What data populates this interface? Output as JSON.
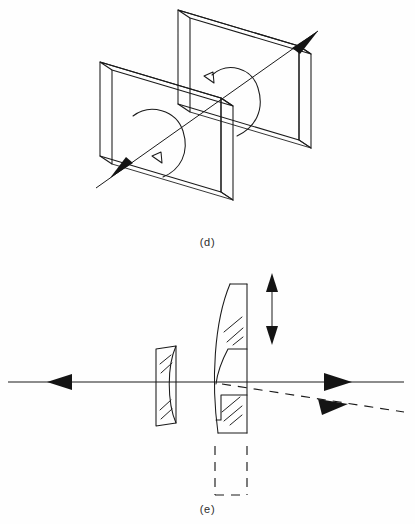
{
  "figure": {
    "kind": "optical-engineering-line-diagram",
    "background_color": "#fefefe",
    "ink_color": "#1a1a1a",
    "width": 415,
    "height": 524
  },
  "panels": [
    {
      "id": "d",
      "caption": "(d)",
      "title_hidden": "counter-rotating tilted plate pair",
      "elements": {
        "plate_front_label": "tilted plate (front)",
        "plate_rear_label": "tilted plate (rear)",
        "axis_label": "common rotation axis",
        "rotation_arrow_upper": "rotation direction (upper plate)",
        "rotation_arrow_lower": "rotation direction (lower plate)"
      }
    },
    {
      "id": "e",
      "caption": "(e)",
      "title_hidden": "decentred lens beam steering",
      "elements": {
        "negative_lens_label": "fixed negative element",
        "positive_lens_label": "translating positive element",
        "ghost_lens_label": "undisplaced lens position",
        "translation_arrow_label": "lens translation",
        "input_ray_label": "input ray",
        "output_ray_solid_label": "undeviated output ray",
        "output_ray_dashed_label": "deviated output ray",
        "optical_axis_label": "optical axis"
      }
    }
  ],
  "captions": {
    "panel_d": "(d)",
    "panel_e": "(e)"
  }
}
